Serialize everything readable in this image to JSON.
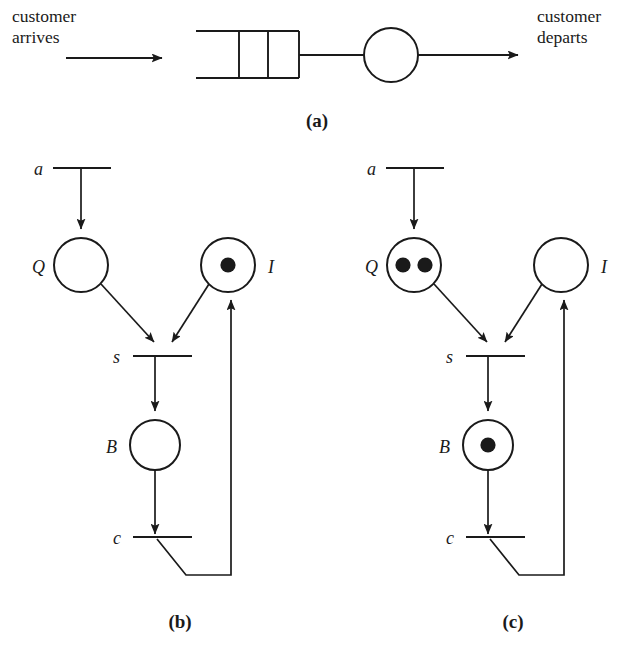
{
  "figure": {
    "title_caption_a": "(a)",
    "title_caption_b": "(b)",
    "title_caption_c": "(c)"
  },
  "panel_a": {
    "caption": "(a)",
    "input_label_line1": "customer",
    "input_label_line2": "arrives",
    "output_label_line1": "customer",
    "output_label_line2": "departs",
    "queue_slots": 3,
    "server_shape": "circle"
  },
  "panel_b": {
    "caption": "(b)",
    "places": [
      {
        "id": "Q",
        "label": "Q",
        "tokens": 0,
        "cx": 81,
        "cy": 265,
        "r": 27
      },
      {
        "id": "I",
        "label": "I",
        "tokens": 1,
        "cx": 228,
        "cy": 265,
        "r": 27
      },
      {
        "id": "B",
        "label": "B",
        "tokens": 0,
        "cx": 155,
        "cy": 445,
        "r": 25
      }
    ],
    "transitions": [
      {
        "id": "a",
        "label": "a",
        "x1": 53,
        "x2": 111,
        "y": 168
      },
      {
        "id": "s",
        "label": "s",
        "x1": 133,
        "x2": 192,
        "y": 356
      },
      {
        "id": "c",
        "label": "c",
        "x1": 133,
        "x2": 192,
        "y": 537
      }
    ]
  },
  "panel_c": {
    "caption": "(c)",
    "places": [
      {
        "id": "Q",
        "label": "Q",
        "tokens": 2,
        "cx": 414,
        "cy": 265,
        "r": 27
      },
      {
        "id": "I",
        "label": "I",
        "tokens": 0,
        "cx": 561,
        "cy": 265,
        "r": 27
      },
      {
        "id": "B",
        "label": "B",
        "tokens": 1,
        "cx": 488,
        "cy": 445,
        "r": 25
      }
    ],
    "transitions": [
      {
        "id": "a",
        "label": "a",
        "x1": 386,
        "x2": 444,
        "y": 168
      },
      {
        "id": "s",
        "label": "s",
        "x1": 466,
        "x2": 525,
        "y": 356
      },
      {
        "id": "c",
        "label": "c",
        "x1": 466,
        "x2": 525,
        "y": 537
      }
    ]
  },
  "net_structure": {
    "description": "Petri net of a single-server queue",
    "arcs": [
      "a -> Q",
      "Q -> s",
      "I -> s",
      "s -> B",
      "B -> c",
      "c -> I"
    ]
  }
}
